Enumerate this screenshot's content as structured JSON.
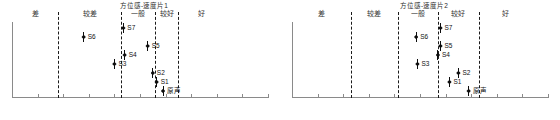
{
  "chart_data": [
    {
      "type": "scatter",
      "title": "方位感-速度片1",
      "xlabel": "",
      "ylabel": "",
      "xlim": [
        -5,
        5
      ],
      "xticks": [
        -5,
        -4,
        -3,
        -2,
        -1,
        0,
        1,
        2,
        3,
        4,
        5
      ],
      "xtick_labels": [
        "-5",
        "-4",
        "-3",
        "-2",
        "-1",
        "0",
        "1",
        "2",
        "3",
        "4",
        "5"
      ],
      "grid": false,
      "legend": "none",
      "category_boundaries": [
        -3.2,
        -0.75,
        0.6,
        1.5
      ],
      "category_bands": [
        {
          "label": "差",
          "center": -4.1
        },
        {
          "label": "较差",
          "center": -1.97
        },
        {
          "label": "一般",
          "center": -0.07
        },
        {
          "label": "较好",
          "center": 1.05
        },
        {
          "label": "好",
          "center": 2.4
        }
      ],
      "points": [
        {
          "label": "S7",
          "x": -0.65,
          "row": 0
        },
        {
          "label": "S6",
          "x": -2.2,
          "row": 1
        },
        {
          "label": "S5",
          "x": 0.3,
          "row": 2
        },
        {
          "label": "S4",
          "x": -0.6,
          "row": 3
        },
        {
          "label": "S3",
          "x": -1.0,
          "row": 4
        },
        {
          "label": "S2",
          "x": 0.5,
          "row": 5
        },
        {
          "label": "S1",
          "x": 0.65,
          "row": 6
        },
        {
          "label": "原声",
          "x": 0.9,
          "row": 7
        }
      ]
    },
    {
      "type": "scatter",
      "title": "方位感-速度片2",
      "xlabel": "",
      "ylabel": "",
      "xlim": [
        -5,
        5
      ],
      "xticks": [
        -5,
        -4,
        -3,
        -2,
        -1,
        0,
        1,
        2,
        3,
        4,
        5
      ],
      "xtick_labels": [
        "-5",
        "-4",
        "-3",
        "-2",
        "-1",
        "0",
        "1",
        "2",
        "3",
        "4",
        "5"
      ],
      "grid": false,
      "legend": "none",
      "category_boundaries": [
        -2.7,
        -0.85,
        0.7,
        2.3
      ],
      "category_bands": [
        {
          "label": "差",
          "center": -3.85
        },
        {
          "label": "较差",
          "center": -1.78
        },
        {
          "label": "一般",
          "center": -0.07
        },
        {
          "label": "较好",
          "center": 1.5
        },
        {
          "label": "好",
          "center": 3.35
        }
      ],
      "points": [
        {
          "label": "S7",
          "x": 0.8,
          "row": 0
        },
        {
          "label": "S6",
          "x": -0.15,
          "row": 1
        },
        {
          "label": "S5",
          "x": 0.8,
          "row": 2
        },
        {
          "label": "S4",
          "x": 0.7,
          "row": 3
        },
        {
          "label": "S3",
          "x": -0.1,
          "row": 4
        },
        {
          "label": "S2",
          "x": 1.5,
          "row": 5
        },
        {
          "label": "S1",
          "x": 1.15,
          "row": 6
        },
        {
          "label": "原声",
          "x": 1.9,
          "row": 7
        }
      ]
    }
  ]
}
